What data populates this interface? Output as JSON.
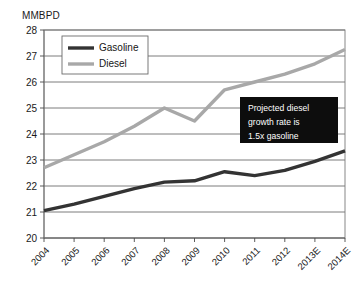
{
  "chart_data": {
    "type": "line",
    "title": "",
    "xlabel": "",
    "ylabel": "MMBPD",
    "ylim": [
      20,
      28
    ],
    "ytick_labels": [
      "28",
      "27",
      "26",
      "25",
      "24",
      "23",
      "22",
      "21",
      "20"
    ],
    "yticks": [
      28,
      27,
      26,
      25,
      24,
      23,
      22,
      21,
      20
    ],
    "grid": true,
    "legend_position": "top-left-inside",
    "categories": [
      "2004",
      "2005",
      "2006",
      "2007",
      "2008",
      "2009",
      "2010",
      "2011",
      "2012",
      "2013E",
      "2014E"
    ],
    "series": [
      {
        "name": "Gasoline",
        "color": "#333333",
        "values": [
          21.05,
          21.3,
          21.6,
          21.9,
          22.15,
          22.2,
          22.55,
          22.4,
          22.6,
          22.95,
          23.35
        ]
      },
      {
        "name": "Diesel",
        "color": "#a8a8a8",
        "values": [
          22.7,
          23.2,
          23.7,
          24.3,
          25.0,
          24.5,
          25.7,
          26.0,
          26.3,
          26.7,
          27.25
        ]
      }
    ],
    "annotations": [
      {
        "name": "projection-callout",
        "lines": [
          "Projected diesel",
          "growth rate is",
          "1.5x gasoline"
        ],
        "background": "#0d0d0d",
        "text_color": "#ffffff"
      }
    ]
  }
}
